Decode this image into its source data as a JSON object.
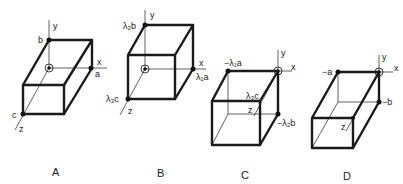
{
  "figure": {
    "panels": [
      {
        "caption": "A",
        "axes": {
          "x": "x",
          "y": "y",
          "z": "z"
        },
        "vertex_labels": {
          "top": "b",
          "right": "a",
          "front": "c"
        }
      },
      {
        "caption": "B",
        "axes": {
          "x": "x",
          "y": "y",
          "z": "z"
        },
        "vertex_labels": {
          "top": "λ₂b",
          "right": "λ₁a",
          "front": "λ₃c"
        }
      },
      {
        "caption": "C",
        "axes": {
          "x": "x",
          "y": "y",
          "z": "z"
        },
        "vertex_labels": {
          "left": "−λ₁a",
          "front": "λ₃c",
          "bottom": "−λ₂b"
        }
      },
      {
        "caption": "D",
        "axes": {
          "x": "x",
          "y": "y",
          "z": "z"
        },
        "vertex_labels": {
          "left": "−a",
          "bottom": "−b"
        }
      }
    ]
  }
}
